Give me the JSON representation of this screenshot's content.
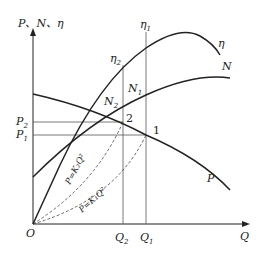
{
  "diagram": {
    "y_axis_label": "P、N、η",
    "x_axis_label": "Q",
    "origin_label": "O",
    "curves": [
      {
        "id": "eta",
        "label": "η",
        "description": "efficiency curve"
      },
      {
        "id": "N",
        "label": "N",
        "description": "shaft power curve"
      },
      {
        "id": "P",
        "label": "P",
        "description": "pressure (head) curve"
      }
    ],
    "system_curves": [
      {
        "id": "k2",
        "label": "P=K₂Q²",
        "style": "dashed"
      },
      {
        "id": "k1",
        "label": "P=K₁Q²",
        "style": "dashed"
      }
    ],
    "operating_points": [
      {
        "label": "1",
        "Q": "Q₁",
        "P": "P₁",
        "N": "N₁",
        "eta": "η₁"
      },
      {
        "label": "2",
        "Q": "Q₂",
        "P": "P₂",
        "N": "N₂",
        "eta": "η₂"
      }
    ],
    "labels": {
      "P1": "P",
      "P1_sub": "1",
      "P2": "P",
      "P2_sub": "2",
      "Q1": "Q",
      "Q1_sub": "1",
      "Q2": "Q",
      "Q2_sub": "2",
      "N1": "N",
      "N1_sub": "1",
      "N2": "N",
      "N2_sub": "2",
      "eta1": "η",
      "eta1_sub": "1",
      "eta2": "η",
      "eta2_sub": "2",
      "eta": "η",
      "N": "N",
      "P": "P",
      "point1": "1",
      "point2": "2",
      "k2_formula": "P=K₂Q²",
      "k1_formula": "P=K₁Q²"
    }
  }
}
